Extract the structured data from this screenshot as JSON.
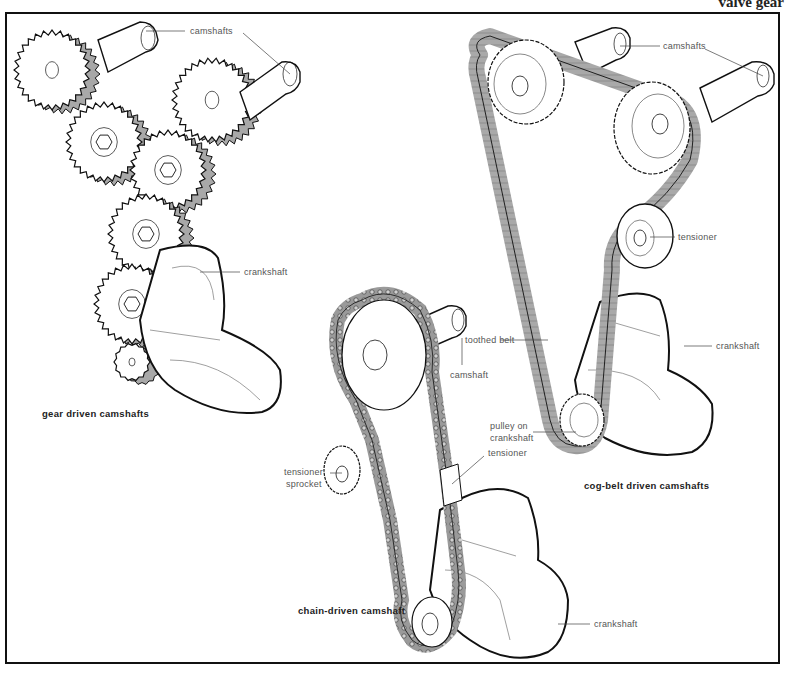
{
  "page": {
    "header_title": "valve gear"
  },
  "diagrams": {
    "gear": {
      "caption": "gear driven camshafts",
      "labels": {
        "camshafts": "camshafts",
        "crankshaft": "crankshaft"
      }
    },
    "chain": {
      "caption": "chain-driven camshaft",
      "labels": {
        "camshaft": "camshaft",
        "tensioner_sprocket_line1": "tensioner",
        "tensioner_sprocket_line2": "sprocket",
        "tensioner": "tensioner",
        "crankshaft": "crankshaft"
      }
    },
    "belt": {
      "caption": "cog-belt driven camshafts",
      "labels": {
        "camshafts": "camshafts",
        "tensioner": "tensioner",
        "crankshaft": "crankshaft",
        "toothed_belt": "toothed belt",
        "pulley_line1": "pulley on",
        "pulley_line2": "crankshaft"
      }
    }
  },
  "colors": {
    "ink": "#111111",
    "shade": "#a8a8a8",
    "label": "#555555"
  }
}
